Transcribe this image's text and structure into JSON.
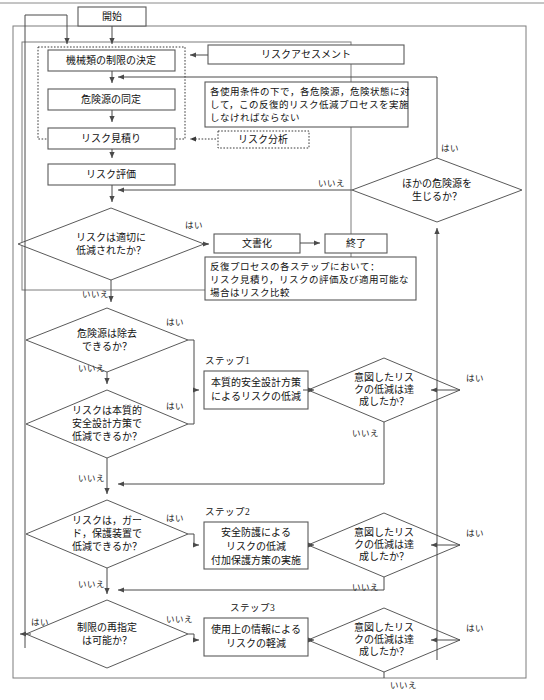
{
  "diagram": {
    "language": "ja"
  },
  "nodes": {
    "start": "開始",
    "determine_limits": "機械類の制限の決定",
    "hazard_identification": "危険源の同定",
    "risk_estimation": "リスク見積り",
    "risk_evaluation": "リスク評価",
    "risk_analysis_label": "リスク分析",
    "risk_assessment_label": "リスクアセスメント",
    "documentation": "文書化",
    "end": "終了",
    "step1_box_line1": "本質的安全設計方策",
    "step1_box_line2": "によるリスクの低減",
    "step2_box_line1": "安全防護による",
    "step2_box_line2": "リスクの低減",
    "step2_box_line3": "付加保護方策の実施",
    "step3_box_line1": "使用上の情報による",
    "step3_box_line2": "リスクの軽減"
  },
  "decisions": {
    "risk_reduced": {
      "line1": "リスクは適切に",
      "line2": "低減されたか？"
    },
    "other_hazards": {
      "line1": "ほかの危険源を",
      "line2": "生じるか？"
    },
    "hazard_removable": {
      "line1": "危険源は除去",
      "line2": "できるか？"
    },
    "inherent_design": {
      "line1": "リスクは本質的",
      "line2": "安全設計方策で",
      "line3": "低減できるか？"
    },
    "guards": {
      "line1": "リスクは，ガー",
      "line2": "ド，保護装置で",
      "line3": "低減できるか？"
    },
    "respecify_limits": {
      "line1": "制限の再指定",
      "line2": "は可能か？"
    },
    "intended_reduction_1": {
      "line1": "意図したリス",
      "line2": "クの低減は達",
      "line3": "成したか？"
    },
    "intended_reduction_2": {
      "line1": "意図したリス",
      "line2": "クの低減は達",
      "line3": "成したか？"
    },
    "intended_reduction_3": {
      "line1": "意図したリス",
      "line2": "クの低減は達",
      "line3": "成したか？"
    }
  },
  "step_labels": {
    "step1": "ステップ1",
    "step2": "ステップ2",
    "step3": "ステップ3"
  },
  "notes": {
    "iterative_note_line1": "各使用条件の下で，各危険源，危険状態に対",
    "iterative_note_line2": "して，この反復的リスク低減プロセスを実施",
    "iterative_note_line3": "しなければならない",
    "each_step_note_line1": "反復プロセスの各ステップにおいて：",
    "each_step_note_line2": "リスク見積り，リスクの評価及び適用可能な",
    "each_step_note_line3": "場合はリスク比較"
  },
  "edge_labels": {
    "yes": "はい",
    "no": "いいえ",
    "yes_risk_reduced": "はい",
    "no_risk_reduced": "いいえ",
    "yes_other_hazards": "はい",
    "no_other_hazards": "いいえ",
    "yes_hazard_removable": "はい",
    "no_hazard_removable": "いいえ",
    "yes_inherent_design": "はい",
    "no_inherent_design": "いいえ",
    "yes_guards": "はい",
    "no_guards": "いいえ",
    "yes_respecify": "はい",
    "no_respecify": "いいえ",
    "yes_intended_1": "はい",
    "no_intended_1": "いいえ",
    "yes_intended_2": "はい",
    "no_intended_2": "いいえ",
    "yes_intended_3": "はい",
    "no_intended_3": "いいえ"
  },
  "colors": {
    "background": "#ffffff",
    "line": "#4a4a4a",
    "box_stroke": "#5a5a5a",
    "frame_stroke": "#7d7d7d",
    "text": "#111111"
  }
}
